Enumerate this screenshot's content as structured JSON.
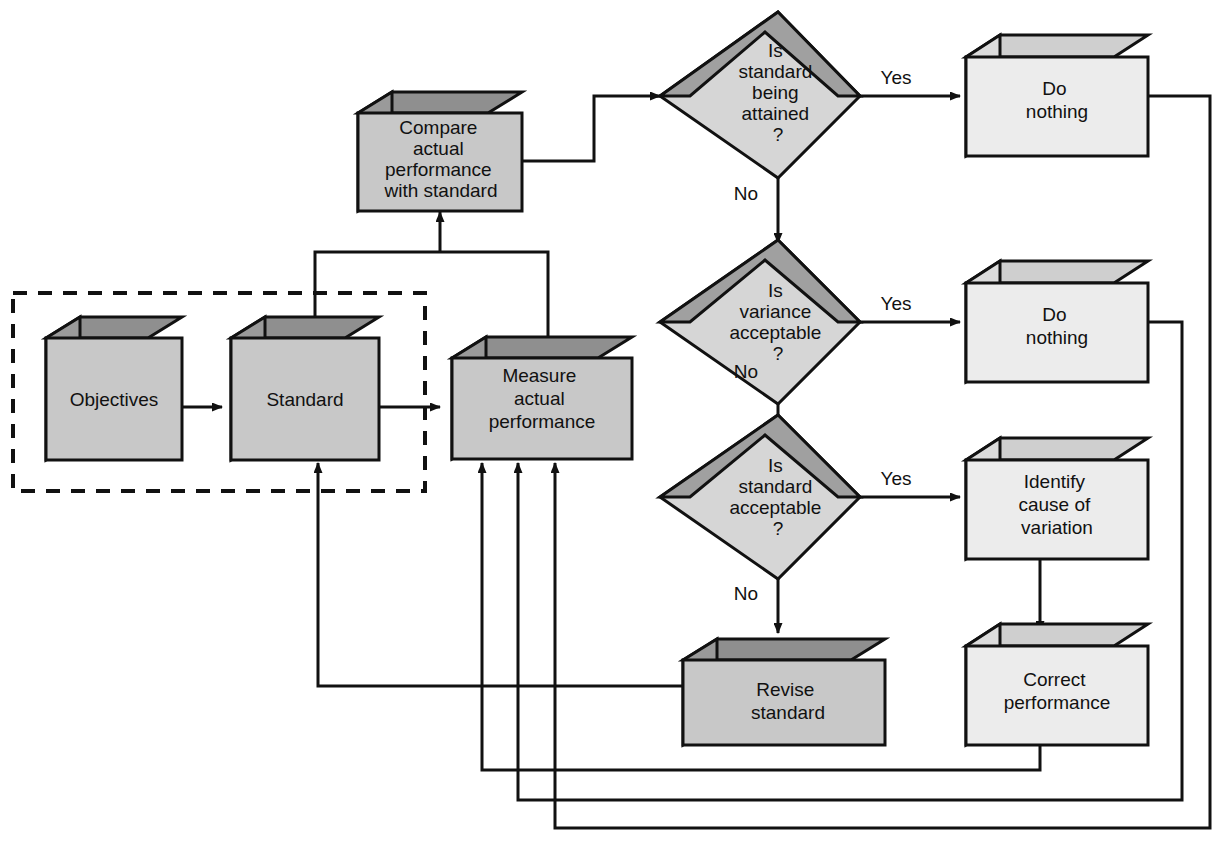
{
  "diagram": {
    "type": "flowchart",
    "colors": {
      "stroke": "#111111",
      "background": "#ffffff",
      "dark_box_face": "#c8c8c8",
      "dark_box_side": "#9a9a9a",
      "dark_box_top": "#8f8f8f",
      "light_box_face": "#ececec",
      "light_box_side": "#dcdcdc",
      "light_box_top": "#cfcfcf",
      "diamond_face": "#d6d6d6",
      "diamond_bevel": "#a0a0a0"
    },
    "dashed_group": {
      "label": "planning-boundary",
      "style": "dashed"
    },
    "nodes": [
      {
        "id": "objectives",
        "shape": "box3d",
        "tone": "dark",
        "lines": [
          "Objectives"
        ]
      },
      {
        "id": "standard",
        "shape": "box3d",
        "tone": "dark",
        "lines": [
          "Standard"
        ]
      },
      {
        "id": "measure",
        "shape": "box3d",
        "tone": "dark",
        "lines": [
          "Measure",
          "actual",
          "performance"
        ]
      },
      {
        "id": "compare",
        "shape": "box3d",
        "tone": "dark",
        "lines": [
          "Compare",
          "actual",
          "performance",
          "with standard"
        ]
      },
      {
        "id": "revise",
        "shape": "box3d",
        "tone": "dark",
        "lines": [
          "Revise",
          "standard"
        ]
      },
      {
        "id": "donothing1",
        "shape": "box3d",
        "tone": "light",
        "lines": [
          "Do",
          "nothing"
        ]
      },
      {
        "id": "donothing2",
        "shape": "box3d",
        "tone": "light",
        "lines": [
          "Do",
          "nothing"
        ]
      },
      {
        "id": "identify",
        "shape": "box3d",
        "tone": "light",
        "lines": [
          "Identify",
          "cause of",
          "variation"
        ]
      },
      {
        "id": "correct",
        "shape": "box3d",
        "tone": "light",
        "lines": [
          "Correct",
          "performance"
        ]
      },
      {
        "id": "attained",
        "shape": "diamond",
        "tone": "bevel",
        "lines": [
          "Is",
          "standard",
          "being",
          "attained",
          "?"
        ]
      },
      {
        "id": "variance",
        "shape": "diamond",
        "tone": "bevel",
        "lines": [
          "Is",
          "variance",
          "acceptable",
          "?"
        ]
      },
      {
        "id": "stdaccept",
        "shape": "diamond",
        "tone": "bevel",
        "lines": [
          "Is",
          "standard",
          "acceptable",
          "?"
        ]
      }
    ],
    "edge_labels": {
      "yes1": "Yes",
      "yes2": "Yes",
      "yes3": "Yes",
      "no1": "No",
      "no2": "No",
      "no3": "No"
    }
  }
}
